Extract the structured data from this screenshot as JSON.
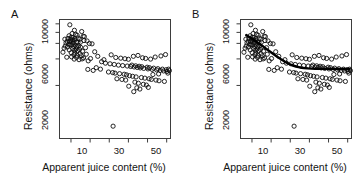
{
  "figure": {
    "width": 363,
    "height": 184,
    "background": "#ffffff"
  },
  "panels": [
    {
      "id": "A",
      "label": "A"
    },
    {
      "id": "B",
      "label": "B"
    }
  ],
  "axis": {
    "xlabel": "Apparent juice content (%)",
    "ylabel": "Resistance (ohms)",
    "x_tick_labels": [
      "10",
      "30",
      "50"
    ],
    "x_ticks_all": [
      10,
      20,
      30,
      40,
      50,
      60
    ],
    "y_tick_labels": [
      "2000",
      "6000",
      "10000"
    ],
    "y_ticks_all": [
      2000,
      6000,
      10000
    ]
  },
  "chart_data": {
    "type": "scatter",
    "title": "",
    "subtitle": "",
    "xlabel": "Apparent juice content (%)",
    "ylabel": "Resistance (ohms)",
    "xlim": [
      4,
      62
    ],
    "ylim": [
      500,
      11200
    ],
    "yscale": "log",
    "grid": false,
    "legend": "none",
    "marker": "open-circle",
    "marker_color": "#0d0d0d",
    "panels": [
      {
        "label": "A",
        "has_fit_curve": false,
        "annotations": []
      },
      {
        "label": "B",
        "has_fit_curve": true,
        "fit_curve_color": "#000000",
        "fit_curve_description": "Fitted declining curve from high resistance at low juice content, flattening above ~35%",
        "fit_curve": {
          "x": [
            7,
            9,
            11,
            13,
            15,
            17,
            19,
            21,
            23,
            25,
            27,
            29,
            31,
            33,
            35,
            37,
            39,
            41,
            43,
            45,
            47,
            49,
            51,
            53,
            55,
            57,
            59,
            61
          ],
          "y": [
            7450,
            7010,
            6560,
            6120,
            5700,
            5300,
            4930,
            4580,
            4260,
            3980,
            3740,
            3540,
            3390,
            3280,
            3200,
            3150,
            3120,
            3100,
            3090,
            3085,
            3080,
            3080,
            3080,
            3080,
            3080,
            3080,
            3080,
            3080
          ]
        },
        "annotations": []
      }
    ],
    "points": [
      {
        "x": 9.4,
        "y": 9750
      },
      {
        "x": 11.8,
        "y": 8450
      },
      {
        "x": 15.6,
        "y": 8180
      },
      {
        "x": 10.6,
        "y": 7760
      },
      {
        "x": 12.4,
        "y": 7600
      },
      {
        "x": 13.2,
        "y": 7420
      },
      {
        "x": 9.0,
        "y": 7320
      },
      {
        "x": 16.4,
        "y": 7240
      },
      {
        "x": 17.0,
        "y": 7160
      },
      {
        "x": 10.2,
        "y": 7060
      },
      {
        "x": 11.0,
        "y": 6980
      },
      {
        "x": 13.8,
        "y": 6900
      },
      {
        "x": 8.4,
        "y": 6830
      },
      {
        "x": 12.0,
        "y": 6760
      },
      {
        "x": 14.6,
        "y": 6700
      },
      {
        "x": 9.8,
        "y": 6640
      },
      {
        "x": 10.8,
        "y": 6580
      },
      {
        "x": 11.6,
        "y": 6520
      },
      {
        "x": 16.8,
        "y": 6460
      },
      {
        "x": 18.4,
        "y": 6400
      },
      {
        "x": 8.0,
        "y": 6340
      },
      {
        "x": 9.2,
        "y": 6290
      },
      {
        "x": 10.0,
        "y": 6240
      },
      {
        "x": 12.8,
        "y": 6190
      },
      {
        "x": 13.6,
        "y": 6140
      },
      {
        "x": 7.4,
        "y": 6080
      },
      {
        "x": 11.2,
        "y": 6020
      },
      {
        "x": 19.6,
        "y": 5980
      },
      {
        "x": 21.0,
        "y": 5930
      },
      {
        "x": 8.8,
        "y": 5870
      },
      {
        "x": 9.6,
        "y": 5820
      },
      {
        "x": 10.4,
        "y": 5770
      },
      {
        "x": 12.2,
        "y": 5720
      },
      {
        "x": 14.0,
        "y": 5660
      },
      {
        "x": 7.0,
        "y": 5600
      },
      {
        "x": 11.4,
        "y": 5540
      },
      {
        "x": 13.0,
        "y": 5480
      },
      {
        "x": 15.0,
        "y": 5420
      },
      {
        "x": 17.6,
        "y": 5360
      },
      {
        "x": 6.4,
        "y": 5300
      },
      {
        "x": 10.9,
        "y": 5240
      },
      {
        "x": 12.6,
        "y": 5180
      },
      {
        "x": 14.4,
        "y": 5120
      },
      {
        "x": 9.1,
        "y": 5060
      },
      {
        "x": 11.9,
        "y": 5000
      },
      {
        "x": 13.4,
        "y": 4940
      },
      {
        "x": 16.0,
        "y": 4880
      },
      {
        "x": 22.4,
        "y": 4820
      },
      {
        "x": 5.8,
        "y": 4760
      },
      {
        "x": 10.1,
        "y": 4700
      },
      {
        "x": 12.1,
        "y": 4640
      },
      {
        "x": 14.8,
        "y": 4580
      },
      {
        "x": 18.0,
        "y": 4520
      },
      {
        "x": 11.5,
        "y": 4460
      },
      {
        "x": 13.1,
        "y": 4400
      },
      {
        "x": 15.4,
        "y": 4340
      },
      {
        "x": 24.0,
        "y": 4280
      },
      {
        "x": 10.3,
        "y": 4220
      },
      {
        "x": 12.9,
        "y": 4160
      },
      {
        "x": 16.6,
        "y": 4100
      },
      {
        "x": 20.2,
        "y": 4040
      },
      {
        "x": 11.7,
        "y": 3980
      },
      {
        "x": 14.2,
        "y": 3920
      },
      {
        "x": 19.0,
        "y": 3800
      },
      {
        "x": 26.0,
        "y": 3720
      },
      {
        "x": 31.0,
        "y": 4450
      },
      {
        "x": 33.4,
        "y": 4150
      },
      {
        "x": 36.0,
        "y": 4080
      },
      {
        "x": 38.2,
        "y": 4020
      },
      {
        "x": 40.0,
        "y": 3960
      },
      {
        "x": 42.6,
        "y": 4280
      },
      {
        "x": 45.0,
        "y": 4380
      },
      {
        "x": 47.4,
        "y": 4120
      },
      {
        "x": 49.0,
        "y": 4050
      },
      {
        "x": 51.6,
        "y": 3980
      },
      {
        "x": 54.0,
        "y": 4200
      },
      {
        "x": 57.0,
        "y": 4320
      },
      {
        "x": 59.4,
        "y": 4480
      },
      {
        "x": 28.0,
        "y": 3580
      },
      {
        "x": 30.4,
        "y": 3520
      },
      {
        "x": 32.6,
        "y": 3460
      },
      {
        "x": 34.8,
        "y": 3400
      },
      {
        "x": 37.0,
        "y": 3360
      },
      {
        "x": 39.4,
        "y": 3320
      },
      {
        "x": 41.2,
        "y": 3280
      },
      {
        "x": 43.0,
        "y": 3240
      },
      {
        "x": 44.6,
        "y": 3200
      },
      {
        "x": 46.2,
        "y": 3160
      },
      {
        "x": 48.0,
        "y": 3120
      },
      {
        "x": 50.2,
        "y": 3080
      },
      {
        "x": 52.4,
        "y": 3040
      },
      {
        "x": 54.8,
        "y": 3000
      },
      {
        "x": 56.6,
        "y": 2960
      },
      {
        "x": 58.4,
        "y": 2920
      },
      {
        "x": 60.2,
        "y": 2880
      },
      {
        "x": 29.6,
        "y": 2840
      },
      {
        "x": 31.8,
        "y": 2800
      },
      {
        "x": 33.0,
        "y": 2760
      },
      {
        "x": 35.4,
        "y": 2720
      },
      {
        "x": 37.8,
        "y": 2680
      },
      {
        "x": 39.0,
        "y": 2640
      },
      {
        "x": 41.8,
        "y": 3400
      },
      {
        "x": 43.8,
        "y": 3340
      },
      {
        "x": 45.6,
        "y": 3300
      },
      {
        "x": 47.0,
        "y": 3260
      },
      {
        "x": 49.8,
        "y": 3220
      },
      {
        "x": 51.0,
        "y": 3180
      },
      {
        "x": 53.2,
        "y": 3140
      },
      {
        "x": 55.4,
        "y": 3100
      },
      {
        "x": 57.8,
        "y": 3060
      },
      {
        "x": 59.8,
        "y": 3020
      },
      {
        "x": 40.6,
        "y": 2580
      },
      {
        "x": 42.2,
        "y": 2540
      },
      {
        "x": 44.0,
        "y": 2500
      },
      {
        "x": 46.8,
        "y": 2460
      },
      {
        "x": 48.6,
        "y": 2420
      },
      {
        "x": 50.8,
        "y": 2380
      },
      {
        "x": 52.0,
        "y": 2340
      },
      {
        "x": 54.4,
        "y": 2300
      },
      {
        "x": 56.0,
        "y": 2260
      },
      {
        "x": 58.8,
        "y": 2220
      },
      {
        "x": 61.0,
        "y": 3060
      },
      {
        "x": 61.4,
        "y": 2940
      },
      {
        "x": 34.0,
        "y": 2380
      },
      {
        "x": 36.6,
        "y": 2340
      },
      {
        "x": 38.6,
        "y": 2300
      },
      {
        "x": 43.4,
        "y": 2180
      },
      {
        "x": 45.2,
        "y": 2120
      },
      {
        "x": 47.8,
        "y": 2060
      },
      {
        "x": 49.4,
        "y": 2020
      },
      {
        "x": 44.4,
        "y": 1880
      },
      {
        "x": 46.0,
        "y": 1820
      },
      {
        "x": 42.8,
        "y": 1700
      },
      {
        "x": 40.2,
        "y": 1960
      },
      {
        "x": 50.4,
        "y": 1900
      },
      {
        "x": 52.8,
        "y": 2660
      },
      {
        "x": 55.8,
        "y": 2700
      },
      {
        "x": 60.6,
        "y": 2760
      },
      {
        "x": 32.0,
        "y": 690
      },
      {
        "x": 23.2,
        "y": 3180
      },
      {
        "x": 25.4,
        "y": 3060
      },
      {
        "x": 27.2,
        "y": 3920
      },
      {
        "x": 21.6,
        "y": 2960
      },
      {
        "x": 18.8,
        "y": 3040
      },
      {
        "x": 15.8,
        "y": 4000
      },
      {
        "x": 7.8,
        "y": 4180
      },
      {
        "x": 6.8,
        "y": 6700
      },
      {
        "x": 8.2,
        "y": 5460
      },
      {
        "x": 14.9,
        "y": 6180
      }
    ]
  }
}
